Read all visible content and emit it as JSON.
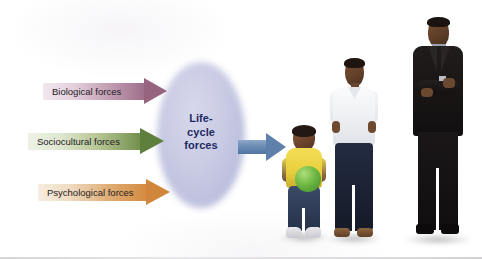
{
  "figure": {
    "background_color": "#ffffff"
  },
  "center": {
    "name": "life-cycle-forces",
    "lines": [
      "Life-",
      "cycle",
      "forces"
    ],
    "text_color": "#1d2a63",
    "shape_color": "#c6c8e2"
  },
  "forces": [
    {
      "id": "biological",
      "label": "Biological forces",
      "color_start": "#f2e7ee",
      "color_end": "#96647f"
    },
    {
      "id": "sociocultural",
      "label": "Sociocultural forces",
      "color_start": "#eef2e6",
      "color_end": "#5f7f3c"
    },
    {
      "id": "psychological",
      "label": "Psychological forces",
      "color_start": "#f6ede0",
      "color_end": "#d1863b"
    }
  ],
  "output": {
    "id": "outcome-arrow",
    "color": "#5d81aa"
  },
  "people": [
    {
      "id": "toddler",
      "description": "toddler holding green ball"
    },
    {
      "id": "teen",
      "description": "adolescent boy in white polo shirt"
    },
    {
      "id": "adult",
      "description": "adult man in dark suit with arms crossed"
    }
  ]
}
